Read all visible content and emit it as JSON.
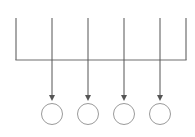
{
  "canvas": {
    "width": 195,
    "height": 137,
    "background": "#ffffff",
    "title": "fanout-bus-diagram"
  },
  "style": {
    "bus_color": "#6e6e6e",
    "arrow_color": "#555555",
    "node_stroke_color": "#9a9a9a",
    "node_fill_color": "#ffffff",
    "bus_stroke_width": 1.2,
    "arrow_stroke_width": 1.0,
    "node_stroke_width": 1.0
  },
  "bus": {
    "name": "horizontal-bus-bar",
    "y": 60,
    "x_start": 16,
    "x_end": 186,
    "left_stem": {
      "x": 16,
      "y_top": 18,
      "y_bottom": 60
    },
    "right_stem": {
      "x": 186,
      "y_top": 18,
      "y_bottom": 60
    }
  },
  "branches": [
    {
      "name": "branch-1",
      "x": 52,
      "y_top": 18,
      "y_bottom": 101
    },
    {
      "name": "branch-2",
      "x": 88,
      "y_top": 18,
      "y_bottom": 101
    },
    {
      "name": "branch-3",
      "x": 124,
      "y_top": 18,
      "y_bottom": 101
    },
    {
      "name": "branch-4",
      "x": 160,
      "y_top": 18,
      "y_bottom": 101
    }
  ],
  "arrowhead": {
    "name": "arrowhead",
    "half_width": 3,
    "height": 6
  },
  "nodes": [
    {
      "name": "node-circle-1",
      "cx": 52,
      "cy": 114,
      "r": 10.5
    },
    {
      "name": "node-circle-2",
      "cx": 88,
      "cy": 114,
      "r": 10.5
    },
    {
      "name": "node-circle-3",
      "cx": 124,
      "cy": 114,
      "r": 10.5
    },
    {
      "name": "node-circle-4",
      "cx": 160,
      "cy": 114,
      "r": 10.5
    }
  ],
  "chart_data": {
    "type": "diagram",
    "title": "",
    "labels": [],
    "annotations": []
  }
}
